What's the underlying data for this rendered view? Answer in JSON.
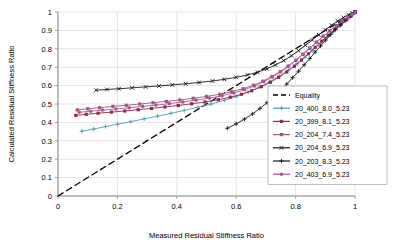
{
  "chart_data": {
    "type": "scatter",
    "title": "",
    "xlabel": "Measured Residual Stiffness Ratio",
    "ylabel": "Calculated Residual Stiffness Ratio",
    "xlim": [
      0,
      1
    ],
    "ylim": [
      0,
      1
    ],
    "xticks": [
      0,
      0.2,
      0.4,
      0.6,
      0.8,
      1
    ],
    "xtick_labels": [
      "0",
      "0.2",
      "0.4",
      "0.6",
      "0.8",
      "1"
    ],
    "yticks": [
      0,
      0.1,
      0.2,
      0.3,
      0.4,
      0.5,
      0.6,
      0.7,
      0.8,
      0.9,
      1
    ],
    "ytick_labels": [
      "0",
      "0.1",
      "0.2",
      "0.3",
      "0.4",
      "0.5",
      "0.6",
      "0.7",
      "0.8",
      "0.9",
      "1"
    ],
    "grid": true,
    "legend_position": "right-middle",
    "series": [
      {
        "name": "Equality",
        "color": "#000000",
        "dash": "6,4",
        "width": 1.3,
        "marker": "none",
        "points": [
          [
            0,
            0
          ],
          [
            1,
            1
          ]
        ]
      },
      {
        "name": "20_400_8.0_5.23",
        "color": "#4f9fad",
        "dash": "none",
        "width": 0.9,
        "marker": "plus",
        "points": [
          [
            0.08,
            0.352
          ],
          [
            0.12,
            0.364
          ],
          [
            0.16,
            0.377
          ],
          [
            0.2,
            0.39
          ],
          [
            0.245,
            0.404
          ],
          [
            0.29,
            0.419
          ],
          [
            0.335,
            0.434
          ],
          [
            0.38,
            0.449
          ],
          [
            0.425,
            0.465
          ],
          [
            0.47,
            0.482
          ],
          [
            0.515,
            0.5
          ],
          [
            0.56,
            0.52
          ],
          [
            0.6,
            0.541
          ],
          [
            0.64,
            0.565
          ],
          [
            0.678,
            0.592
          ],
          [
            0.712,
            0.62
          ],
          [
            0.745,
            0.651
          ],
          [
            0.775,
            0.684
          ],
          [
            0.805,
            0.719
          ],
          [
            0.832,
            0.755
          ],
          [
            0.858,
            0.791
          ],
          [
            0.882,
            0.827
          ],
          [
            0.905,
            0.861
          ],
          [
            0.928,
            0.893
          ],
          [
            0.95,
            0.923
          ],
          [
            0.968,
            0.949
          ],
          [
            0.983,
            0.97
          ],
          [
            0.994,
            0.988
          ],
          [
            1.0,
            1.0
          ]
        ]
      },
      {
        "name": "20_399_8.1_5.23",
        "color": "#8c2b4a",
        "dash": "none",
        "width": 0.9,
        "marker": "square",
        "points": [
          [
            0.06,
            0.438
          ],
          [
            0.095,
            0.444
          ],
          [
            0.135,
            0.45
          ],
          [
            0.18,
            0.456
          ],
          [
            0.225,
            0.462
          ],
          [
            0.27,
            0.469
          ],
          [
            0.315,
            0.476
          ],
          [
            0.36,
            0.484
          ],
          [
            0.405,
            0.492
          ],
          [
            0.45,
            0.501
          ],
          [
            0.495,
            0.511
          ],
          [
            0.54,
            0.523
          ],
          [
            0.58,
            0.537
          ],
          [
            0.618,
            0.553
          ],
          [
            0.652,
            0.572
          ],
          [
            0.685,
            0.594
          ],
          [
            0.715,
            0.618
          ],
          [
            0.743,
            0.645
          ],
          [
            0.77,
            0.674
          ],
          [
            0.796,
            0.706
          ],
          [
            0.82,
            0.739
          ],
          [
            0.843,
            0.773
          ],
          [
            0.866,
            0.808
          ],
          [
            0.888,
            0.842
          ],
          [
            0.91,
            0.874
          ],
          [
            0.932,
            0.905
          ],
          [
            0.953,
            0.933
          ],
          [
            0.972,
            0.958
          ],
          [
            0.987,
            0.978
          ],
          [
            1.0,
            1.0
          ]
        ]
      },
      {
        "name": "20_204_7.4_5.23",
        "color": "#a0567b",
        "dash": "none",
        "width": 0.9,
        "marker": "square",
        "points": [
          [
            0.065,
            0.468
          ],
          [
            0.1,
            0.474
          ],
          [
            0.14,
            0.48
          ],
          [
            0.185,
            0.487
          ],
          [
            0.23,
            0.493
          ],
          [
            0.275,
            0.5
          ],
          [
            0.32,
            0.507
          ],
          [
            0.365,
            0.514
          ],
          [
            0.41,
            0.522
          ],
          [
            0.455,
            0.531
          ],
          [
            0.5,
            0.541
          ],
          [
            0.545,
            0.553
          ],
          [
            0.585,
            0.567
          ],
          [
            0.623,
            0.583
          ],
          [
            0.658,
            0.602
          ],
          [
            0.69,
            0.624
          ],
          [
            0.72,
            0.649
          ],
          [
            0.748,
            0.676
          ],
          [
            0.775,
            0.706
          ],
          [
            0.8,
            0.737
          ],
          [
            0.824,
            0.77
          ],
          [
            0.847,
            0.803
          ],
          [
            0.87,
            0.836
          ],
          [
            0.893,
            0.868
          ],
          [
            0.915,
            0.898
          ],
          [
            0.937,
            0.925
          ],
          [
            0.957,
            0.95
          ],
          [
            0.975,
            0.971
          ],
          [
            0.989,
            0.987
          ],
          [
            1.0,
            1.0
          ]
        ]
      },
      {
        "name": "20_204_6.9_5.23",
        "color": "#1a1a1a",
        "dash": "none",
        "width": 0.9,
        "marker": "x",
        "points": [
          [
            0.128,
            0.575
          ],
          [
            0.165,
            0.579
          ],
          [
            0.205,
            0.583
          ],
          [
            0.25,
            0.588
          ],
          [
            0.295,
            0.593
          ],
          [
            0.34,
            0.598
          ],
          [
            0.385,
            0.604
          ],
          [
            0.43,
            0.61
          ],
          [
            0.475,
            0.617
          ],
          [
            0.52,
            0.625
          ],
          [
            0.56,
            0.634
          ],
          [
            0.6,
            0.645
          ],
          [
            0.638,
            0.658
          ],
          [
            0.672,
            0.673
          ],
          [
            0.703,
            0.691
          ],
          [
            0.732,
            0.712
          ],
          [
            0.76,
            0.736
          ],
          [
            0.786,
            0.762
          ],
          [
            0.81,
            0.79
          ],
          [
            0.833,
            0.819
          ],
          [
            0.856,
            0.848
          ],
          [
            0.878,
            0.876
          ],
          [
            0.9,
            0.903
          ],
          [
            0.921,
            0.928
          ],
          [
            0.942,
            0.951
          ],
          [
            0.961,
            0.97
          ],
          [
            0.978,
            0.985
          ],
          [
            0.991,
            0.995
          ],
          [
            1.0,
            1.0
          ]
        ]
      },
      {
        "name": "20_203_8.3_5.23",
        "color": "#1a1a1a",
        "dash": "none",
        "width": 0.9,
        "marker": "plus",
        "points": [
          [
            0.57,
            0.368
          ],
          [
            0.6,
            0.392
          ],
          [
            0.628,
            0.418
          ],
          [
            0.655,
            0.446
          ],
          [
            0.68,
            0.476
          ],
          [
            0.704,
            0.507
          ],
          [
            0.727,
            0.54
          ],
          [
            0.749,
            0.574
          ],
          [
            0.77,
            0.608
          ],
          [
            0.79,
            0.643
          ],
          [
            0.81,
            0.678
          ],
          [
            0.829,
            0.713
          ],
          [
            0.848,
            0.748
          ],
          [
            0.866,
            0.782
          ],
          [
            0.884,
            0.815
          ],
          [
            0.901,
            0.847
          ],
          [
            0.918,
            0.877
          ],
          [
            0.934,
            0.905
          ],
          [
            0.95,
            0.931
          ],
          [
            0.964,
            0.954
          ],
          [
            0.977,
            0.973
          ],
          [
            0.988,
            0.987
          ],
          [
            1.0,
            1.0
          ]
        ]
      },
      {
        "name": "20_403_6.9_5.23",
        "color": "#b0539c",
        "dash": "none",
        "width": 0.9,
        "marker": "circle",
        "points": [
          [
            0.072,
            0.455
          ],
          [
            0.11,
            0.461
          ],
          [
            0.15,
            0.467
          ],
          [
            0.195,
            0.473
          ],
          [
            0.24,
            0.48
          ],
          [
            0.285,
            0.487
          ],
          [
            0.33,
            0.494
          ],
          [
            0.375,
            0.502
          ],
          [
            0.42,
            0.511
          ],
          [
            0.465,
            0.521
          ],
          [
            0.51,
            0.532
          ],
          [
            0.552,
            0.545
          ],
          [
            0.592,
            0.56
          ],
          [
            0.628,
            0.578
          ],
          [
            0.662,
            0.598
          ],
          [
            0.693,
            0.621
          ],
          [
            0.722,
            0.647
          ],
          [
            0.75,
            0.675
          ],
          [
            0.776,
            0.705
          ],
          [
            0.801,
            0.737
          ],
          [
            0.825,
            0.77
          ],
          [
            0.848,
            0.803
          ],
          [
            0.871,
            0.836
          ],
          [
            0.893,
            0.868
          ],
          [
            0.915,
            0.898
          ],
          [
            0.937,
            0.926
          ],
          [
            0.957,
            0.951
          ],
          [
            0.975,
            0.972
          ],
          [
            0.99,
            0.988
          ],
          [
            1.0,
            1.0
          ]
        ]
      }
    ]
  }
}
